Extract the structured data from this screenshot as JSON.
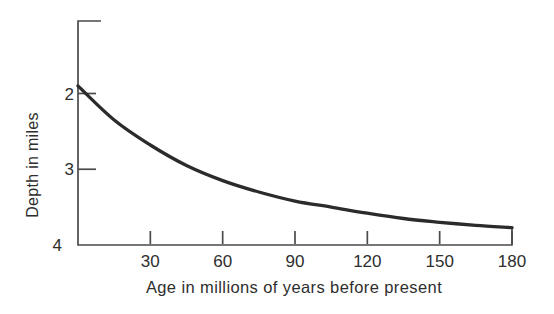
{
  "figure": {
    "background": "#ffffff",
    "ink_color": "#2b2b2b",
    "axis_color": "#4a4a4a",
    "text_color": "#2e2e2e"
  },
  "chart_data": {
    "type": "line",
    "title": "",
    "xlabel": "Age in millions of years before present",
    "ylabel": "Depth in miles",
    "xlim": [
      0,
      180
    ],
    "ylim": [
      1,
      4
    ],
    "y_axis_inverted": true,
    "grid": false,
    "legend": "none",
    "x_ticks": [
      30,
      60,
      90,
      120,
      150,
      180
    ],
    "x_tick_labels": [
      "30",
      "60",
      "90",
      "120",
      "150",
      "180"
    ],
    "y_ticks": [
      2,
      3,
      4
    ],
    "y_tick_labels": [
      "2",
      "3",
      "4"
    ],
    "series": [
      {
        "name": "ocean-floor-depth-curve",
        "x": [
          0,
          15,
          30,
          45,
          60,
          75,
          90,
          105,
          120,
          135,
          150,
          165,
          180
        ],
        "y": [
          1.9,
          2.35,
          2.68,
          2.95,
          3.15,
          3.3,
          3.42,
          3.5,
          3.58,
          3.65,
          3.7,
          3.74,
          3.77
        ]
      }
    ]
  }
}
